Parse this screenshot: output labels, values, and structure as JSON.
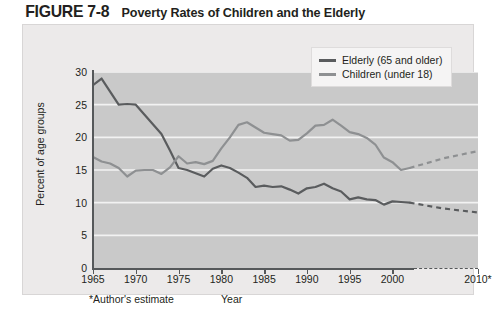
{
  "figure": {
    "number": "FIGURE 7-8",
    "title": "Poverty Rates of Children and the Elderly"
  },
  "legend": {
    "position": "top-right",
    "entries": [
      {
        "label": "Elderly (65 and older)",
        "color": "#5a5c5e",
        "icon": "line-swatch"
      },
      {
        "label": "Children (under 18)",
        "color": "#8e9092",
        "icon": "line-swatch"
      }
    ]
  },
  "axes": {
    "y_title": "Percent of age groups",
    "y_ticks": [
      "0",
      "5",
      "10",
      "15",
      "20",
      "25",
      "30"
    ],
    "x_title": "Year",
    "x_ticks": [
      "1965",
      "1970",
      "1975",
      "1980",
      "1985",
      "1990",
      "1995",
      "2000",
      "2010*"
    ],
    "footnote": "*Author's estimate"
  },
  "chart_data": {
    "type": "line",
    "title": "Poverty Rates of Children and the Elderly",
    "xlabel": "Year",
    "ylabel": "Percent of age groups",
    "xlim": [
      1965,
      2010
    ],
    "ylim": [
      0,
      30
    ],
    "ytick_step": 5,
    "grid": "horizontal-white",
    "plot_background": "#c9c9c9",
    "legend_position": "top-right",
    "annotations": [
      "*Author's estimate"
    ],
    "series": [
      {
        "name": "Elderly (65 and older)",
        "color": "#5a5c5e",
        "x": [
          1965,
          1966,
          1967,
          1968,
          1969,
          1970,
          1971,
          1972,
          1973,
          1974,
          1975,
          1976,
          1977,
          1978,
          1979,
          1980,
          1981,
          1982,
          1983,
          1984,
          1985,
          1986,
          1987,
          1988,
          1989,
          1990,
          1991,
          1992,
          1993,
          1994,
          1995,
          1996,
          1997,
          1998,
          1999,
          2000,
          2001,
          2002
        ],
        "y": [
          28.0,
          29.0,
          27.0,
          25.0,
          25.1,
          25.0,
          23.5,
          22.0,
          20.5,
          18.0,
          15.3,
          15.0,
          14.5,
          14.0,
          15.2,
          15.7,
          15.3,
          14.6,
          13.8,
          12.4,
          12.6,
          12.4,
          12.5,
          12.0,
          11.4,
          12.2,
          12.4,
          12.9,
          12.2,
          11.7,
          10.5,
          10.8,
          10.5,
          10.4,
          9.7,
          10.2,
          10.1,
          10.0
        ],
        "projection": {
          "style": "dashed",
          "x": [
            2002,
            2006,
            2010
          ],
          "y": [
            10.0,
            9.1,
            8.5
          ]
        }
      },
      {
        "name": "Children (under 18)",
        "color": "#8e9092",
        "x": [
          1965,
          1966,
          1967,
          1968,
          1969,
          1970,
          1971,
          1972,
          1973,
          1974,
          1975,
          1976,
          1977,
          1978,
          1979,
          1980,
          1981,
          1982,
          1983,
          1984,
          1985,
          1986,
          1987,
          1988,
          1989,
          1990,
          1991,
          1992,
          1993,
          1994,
          1995,
          1996,
          1997,
          1998,
          1999,
          2000,
          2001,
          2002
        ],
        "y": [
          17.0,
          16.3,
          16.0,
          15.3,
          14.0,
          14.9,
          15.0,
          15.0,
          14.4,
          15.4,
          17.1,
          16.0,
          16.2,
          15.9,
          16.4,
          18.3,
          20.0,
          21.9,
          22.3,
          21.5,
          20.7,
          20.5,
          20.3,
          19.5,
          19.6,
          20.6,
          21.8,
          21.9,
          22.7,
          21.8,
          20.8,
          20.5,
          19.9,
          18.9,
          16.9,
          16.2,
          15.0,
          15.3
        ],
        "projection": {
          "style": "dashed",
          "x": [
            2002,
            2006,
            2010
          ],
          "y": [
            15.3,
            16.8,
            17.9
          ]
        }
      }
    ]
  }
}
